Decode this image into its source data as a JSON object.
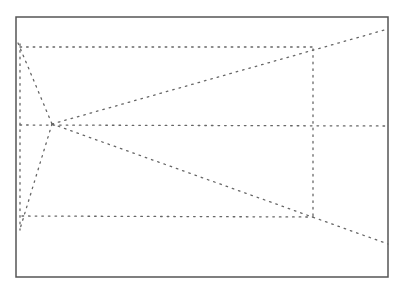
{
  "diagram": {
    "frame": {
      "x": 16,
      "y": 17,
      "width": 372,
      "height": 260,
      "stroke": "#555555",
      "stroke_width": 1.5
    },
    "dot_color": "#666666",
    "points": {
      "top_left_start": [
        18,
        43
      ],
      "convergence": [
        52,
        124
      ],
      "bottom_left_end": [
        20,
        229
      ],
      "top_right_junction": [
        313,
        47
      ],
      "bottom_right_junction": [
        313,
        217
      ],
      "right_upper_end": [
        388,
        29
      ],
      "right_lower_end": [
        388,
        244
      ]
    },
    "lines": [
      {
        "name": "left-vertical",
        "x1": 20,
        "y1": 44,
        "x2": 20,
        "y2": 230
      },
      {
        "name": "top-horizontal",
        "x1": 20,
        "y1": 47,
        "x2": 313,
        "y2": 47
      },
      {
        "name": "middle-horizontal",
        "x1": 20,
        "y1": 125,
        "x2": 388,
        "y2": 126
      },
      {
        "name": "bottom-horizontal",
        "x1": 22,
        "y1": 216,
        "x2": 313,
        "y2": 217
      },
      {
        "name": "right-vertical",
        "x1": 313,
        "y1": 49,
        "x2": 313,
        "y2": 218
      },
      {
        "name": "upper-left-diagonal",
        "x1": 18,
        "y1": 43,
        "x2": 52,
        "y2": 124
      },
      {
        "name": "lower-left-diagonal",
        "x1": 52,
        "y1": 124,
        "x2": 20,
        "y2": 229
      },
      {
        "name": "upper-ray",
        "x1": 52,
        "y1": 124,
        "x2": 388,
        "y2": 29
      },
      {
        "name": "lower-ray",
        "x1": 52,
        "y1": 124,
        "x2": 388,
        "y2": 244
      }
    ]
  }
}
